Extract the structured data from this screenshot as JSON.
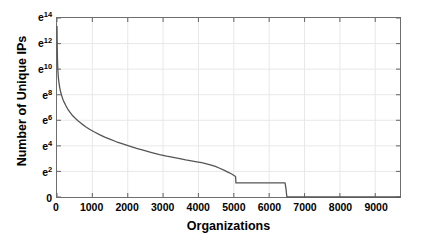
{
  "chart_data": {
    "type": "line",
    "title": "",
    "xlabel": "Organizations",
    "ylabel": "Number of Unique IPs",
    "xlim": [
      0,
      9700
    ],
    "ylim": [
      0,
      14
    ],
    "yscale": "log-e",
    "grid": true,
    "legend": null,
    "xticks": [
      0,
      1000,
      2000,
      3000,
      4000,
      5000,
      6000,
      7000,
      8000,
      9000
    ],
    "xtick_labels": [
      "0",
      "1000",
      "2000",
      "3000",
      "4000",
      "5000",
      "6000",
      "7000",
      "8000",
      "9000"
    ],
    "yticks": [
      0,
      2,
      4,
      6,
      8,
      10,
      12,
      14
    ],
    "ytick_labels": [
      "0",
      "e2",
      "e4",
      "e6",
      "e8",
      "e10",
      "e12",
      "e14"
    ],
    "ytick_bases": [
      "0",
      "e",
      "e",
      "e",
      "e",
      "e",
      "e",
      "e"
    ],
    "ytick_exponents": [
      "",
      "2",
      "4",
      "6",
      "8",
      "10",
      "12",
      "14"
    ],
    "series": [
      {
        "name": "Unique IPs per organization (rank-ordered)",
        "color": "#555555",
        "linewidth": 1.3,
        "x": [
          0,
          5,
          10,
          18,
          28,
          40,
          55,
          75,
          100,
          130,
          165,
          205,
          250,
          300,
          360,
          430,
          510,
          600,
          700,
          810,
          930,
          1060,
          1200,
          1350,
          1510,
          1680,
          1860,
          2050,
          2250,
          2460,
          2680,
          2900,
          3100,
          3290,
          3470,
          3640,
          3800,
          3950,
          4090,
          4230,
          4360,
          4480,
          4600,
          4720,
          4830,
          4940,
          5050,
          5060,
          5500,
          6000,
          6450,
          6480,
          6500,
          9700
        ],
        "y": [
          13.35,
          12.1,
          11.1,
          10.3,
          9.75,
          9.3,
          8.95,
          8.6,
          8.25,
          7.95,
          7.65,
          7.4,
          7.15,
          6.9,
          6.65,
          6.4,
          6.18,
          5.95,
          5.72,
          5.5,
          5.28,
          5.08,
          4.88,
          4.68,
          4.5,
          4.32,
          4.15,
          3.98,
          3.8,
          3.64,
          3.48,
          3.32,
          3.2,
          3.1,
          3.0,
          2.9,
          2.82,
          2.75,
          2.68,
          2.6,
          2.5,
          2.4,
          2.25,
          2.1,
          1.95,
          1.8,
          1.6,
          1.1,
          1.1,
          1.1,
          1.1,
          0.55,
          0.0,
          0.0
        ]
      }
    ],
    "annotations": []
  },
  "axes": {
    "xaxis_title": "Organizations",
    "yaxis_title": "Number of Unique IPs"
  },
  "colors": {
    "curve": "#555555",
    "frame": "#6e6e6e",
    "grid": "#e8e8e8",
    "text": "#000000",
    "background": "#ffffff"
  }
}
